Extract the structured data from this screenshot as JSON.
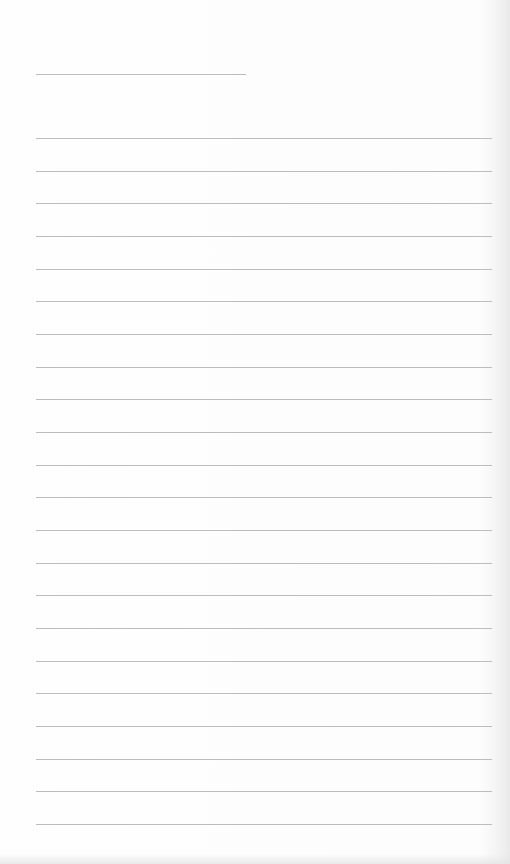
{
  "page": {
    "type": "blank lined writing page",
    "background_color": "#fdfdfd",
    "line_color": "#bcbcbc",
    "header_line": {
      "left": 36,
      "top": 74,
      "width": 210
    },
    "ruled_lines": {
      "count": 22,
      "left": 36,
      "width": 456,
      "first_top": 138,
      "spacing": 32.67
    }
  }
}
